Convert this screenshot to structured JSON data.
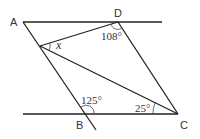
{
  "diagram": {
    "type": "geometry",
    "points": {
      "A": {
        "label": "A",
        "x": 23,
        "y": 22
      },
      "D": {
        "label": "D",
        "x": 118,
        "y": 22
      },
      "B": {
        "label": "B",
        "x": 86,
        "y": 114
      },
      "C": {
        "label": "C",
        "x": 178,
        "y": 114
      },
      "E": {
        "label": "",
        "x": 40,
        "y": 46
      }
    },
    "angles": {
      "x": "x",
      "angle_D": "108°",
      "angle_B": "125°",
      "angle_C": "25°"
    }
  }
}
